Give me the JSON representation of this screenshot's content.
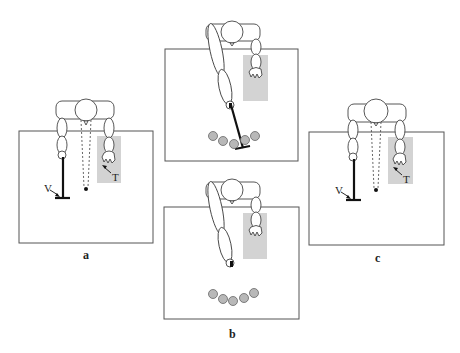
{
  "figure": {
    "panels": [
      {
        "id": "a",
        "label": "a",
        "annotations": {
          "tool_label": "V",
          "target_label": "T"
        },
        "description": "Left arm holding vertical tool (V) with dotted sight lines to fixation dot; right hand in gray target zone (T)"
      },
      {
        "id": "b",
        "label": "b",
        "subpanels": [
          {
            "position": "top",
            "description": "Left arm extended holding rake tool reaching toward arc of five balls"
          },
          {
            "position": "bottom",
            "description": "Left arm extended without tool; arc of five balls"
          }
        ],
        "ball_count": 5
      },
      {
        "id": "c",
        "label": "c",
        "annotations": {
          "tool_label": "V",
          "target_label": "T"
        },
        "description": "Same configuration as panel a"
      }
    ],
    "colors": {
      "outline": "#555555",
      "target_zone": "#d3d3d3",
      "ball": "#b8b8b8",
      "tool": "#111111"
    }
  }
}
